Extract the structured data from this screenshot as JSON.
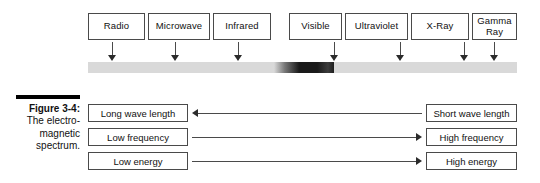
{
  "figure": {
    "caption_title": "Figure 3-4:",
    "caption_body_line1": "The electro-",
    "caption_body_line2": "magnetic",
    "caption_body_line3": "spectrum."
  },
  "colors": {
    "bar_base": "#d9d9d9",
    "visible_band_dark": "#1a1a1a",
    "box_border": "#4a4a4a",
    "arrow": "#2b2b2b",
    "caption_rule": "#000000",
    "text": "#111111"
  },
  "spectrum": {
    "bands": [
      {
        "label": "Radio",
        "box_left": 88,
        "box_width": 57,
        "arrow_x": 112
      },
      {
        "label": "Microwave",
        "box_left": 148,
        "box_width": 62,
        "arrow_x": 175
      },
      {
        "label": "Infrared",
        "box_left": 213,
        "box_width": 58,
        "arrow_x": 238
      },
      {
        "label": "Visible",
        "box_left": 289,
        "box_width": 53,
        "arrow_x": 334
      },
      {
        "label": "Ultraviolet",
        "box_left": 345,
        "box_width": 63,
        "arrow_x": 400
      },
      {
        "label": "X-Ray",
        "box_left": 411,
        "box_width": 58,
        "arrow_x": 464
      },
      {
        "label": "Gamma\nRay",
        "box_left": 472,
        "box_width": 45,
        "arrow_x": 494
      }
    ],
    "bar": {
      "left": 88,
      "width": 429,
      "top": 62,
      "height": 11,
      "visible_band_left": 186,
      "visible_band_width": 60,
      "visible_band_gradient": "linear-gradient(to right, rgba(217,217,217,1) 0%, rgba(120,120,120,1) 18%, rgba(26,26,26,1) 42%, rgba(26,26,26,1) 72%, rgba(60,60,60,1) 90%, rgba(30,30,30,1) 100%)"
    }
  },
  "comparisons": {
    "rows": [
      {
        "left_label": "Long wave length",
        "right_label": "Short wave length",
        "direction": "left",
        "left_box_left": 88,
        "left_box_width": 100,
        "right_box_left": 426,
        "right_box_width": 91,
        "top": 104
      },
      {
        "left_label": "Low frequency",
        "right_label": "High frequency",
        "direction": "right",
        "left_box_left": 88,
        "left_box_width": 100,
        "right_box_left": 426,
        "right_box_width": 91,
        "top": 128
      },
      {
        "left_label": "Low energy",
        "right_label": "High energy",
        "direction": "right",
        "left_box_left": 88,
        "left_box_width": 100,
        "right_box_left": 426,
        "right_box_width": 91,
        "top": 152
      }
    ]
  }
}
